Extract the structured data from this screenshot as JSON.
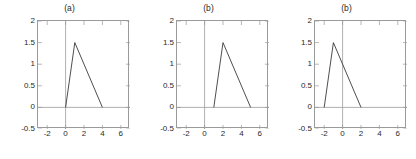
{
  "figure": {
    "background": "#ffffff",
    "line_color": "#3a3a3a",
    "axis_color": "#9a9a9a",
    "tick_color": "#2a2a2a"
  },
  "chart_data": [
    {
      "type": "line",
      "title": "(a)",
      "xlabel": "",
      "ylabel": "",
      "xlim": [
        -3,
        7
      ],
      "ylim": [
        -0.5,
        2
      ],
      "xticks": [
        -2,
        0,
        2,
        4,
        6
      ],
      "xticklabels": [
        "-2",
        "0",
        "2",
        "4",
        "6"
      ],
      "yticks": [
        -0.5,
        0,
        0.5,
        1,
        1.5,
        2
      ],
      "yticklabels": [
        "-0.5",
        "0",
        "0.5",
        "1",
        "1.5",
        "2"
      ],
      "grid": false,
      "legend": null,
      "axis_lines": {
        "x_axis_at_y": 0,
        "y_axis_at_x": 0
      },
      "series": [
        {
          "name": "triangular pulse",
          "x": [
            0,
            1,
            4
          ],
          "y": [
            0,
            1.5,
            0
          ]
        }
      ]
    },
    {
      "type": "line",
      "title": "(b)",
      "xlabel": "",
      "ylabel": "",
      "xlim": [
        -3,
        7
      ],
      "ylim": [
        -0.5,
        2
      ],
      "xticks": [
        -2,
        0,
        2,
        4,
        6
      ],
      "xticklabels": [
        "-2",
        "0",
        "2",
        "4",
        "6"
      ],
      "yticks": [
        -0.5,
        0,
        0.5,
        1,
        1.5,
        2
      ],
      "yticklabels": [
        "-0.5",
        "0",
        "0.5",
        "1",
        "1.5",
        "2"
      ],
      "grid": false,
      "legend": null,
      "axis_lines": {
        "x_axis_at_y": 0,
        "y_axis_at_x": 0
      },
      "series": [
        {
          "name": "triangular pulse",
          "x": [
            1,
            2,
            5
          ],
          "y": [
            0,
            1.5,
            0
          ]
        }
      ]
    },
    {
      "type": "line",
      "title": "(b)",
      "xlabel": "",
      "ylabel": "",
      "xlim": [
        -3,
        7
      ],
      "ylim": [
        -0.5,
        2
      ],
      "xticks": [
        -2,
        0,
        2,
        4,
        6
      ],
      "xticklabels": [
        "-2",
        "0",
        "2",
        "4",
        "6"
      ],
      "yticks": [
        -0.5,
        0,
        0.5,
        1,
        1.5,
        2
      ],
      "yticklabels": [
        "-0.5",
        "0",
        "0.5",
        "1",
        "1.5",
        "2"
      ],
      "grid": false,
      "legend": null,
      "axis_lines": {
        "x_axis_at_y": 0,
        "y_axis_at_x": 0
      },
      "series": [
        {
          "name": "triangular pulse",
          "x": [
            -2,
            -1,
            2
          ],
          "y": [
            0,
            1.5,
            0
          ]
        }
      ]
    }
  ]
}
